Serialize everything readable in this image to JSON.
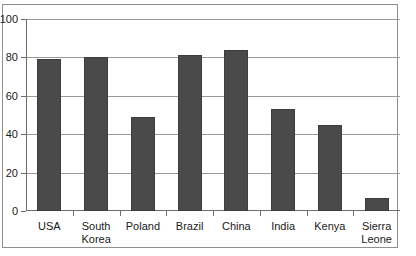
{
  "chart_data": {
    "type": "bar",
    "title": "",
    "subtitle": "",
    "xlabel": "",
    "ylabel": "",
    "categories": [
      "USA",
      "South Korea",
      "Poland",
      "Brazil",
      "China",
      "India",
      "Kenya",
      "Sierra Leone"
    ],
    "values": [
      79,
      80,
      49,
      81,
      84,
      53,
      45,
      7
    ],
    "ylim": [
      0,
      100
    ],
    "ytick_labels": [
      "0",
      "20",
      "40",
      "60",
      "80",
      "100"
    ],
    "ytick_values": [
      0,
      20,
      40,
      60,
      80,
      100
    ],
    "grid": true,
    "legend": null,
    "bar_color": "#4a4a4a",
    "gridline_color": "#9a9a9a",
    "axis_color": "#6d6d6d",
    "frame_color": "#8f8f8f",
    "background_color": "#ffffff",
    "text_color": "#1a1a1a"
  }
}
